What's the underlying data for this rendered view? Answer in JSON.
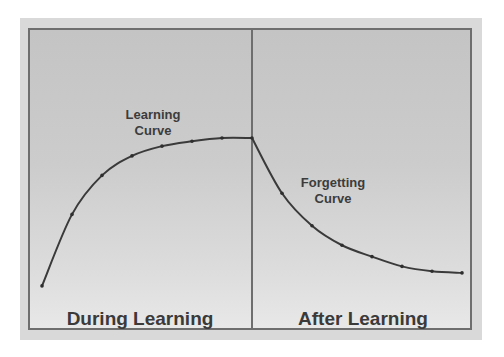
{
  "labels": {
    "learning_curve": "Learning Curve",
    "forgetting_curve": "Forgetting Curve",
    "during": "During Learning",
    "after": "After Learning"
  },
  "colors": {
    "background": "#cccccc",
    "border": "#6e6e6e",
    "line": "#3a3a3a",
    "text": "#3c3c3c"
  },
  "chart_data": {
    "type": "line",
    "title": "",
    "xlabel": "",
    "ylabel": "",
    "grid": false,
    "legend": "none",
    "ylim": [
      0,
      100
    ],
    "regions": [
      "During Learning",
      "After Learning"
    ],
    "series": [
      {
        "name": "Learning Curve",
        "x": [
          0,
          1,
          2,
          3,
          4,
          5,
          6,
          7
        ],
        "values": [
          9,
          53,
          77,
          89,
          95,
          98,
          100,
          100
        ]
      },
      {
        "name": "Forgetting Curve",
        "x": [
          7,
          8,
          9,
          10,
          11,
          12,
          13,
          14
        ],
        "values": [
          100,
          66,
          46,
          34,
          27,
          21,
          18,
          17
        ]
      }
    ],
    "annotations": [
      "Learning Curve",
      "Forgetting Curve",
      "During Learning",
      "After Learning"
    ]
  }
}
